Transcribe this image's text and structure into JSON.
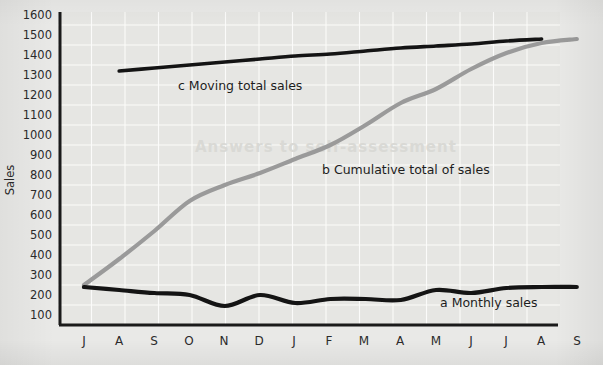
{
  "chart_data": {
    "type": "line",
    "title": "",
    "xlabel": "",
    "ylabel": "Sales",
    "ylim": [
      0,
      1600
    ],
    "ytick_step": 100,
    "grid": true,
    "legend": "inline-annotations",
    "categories": [
      "J",
      "A",
      "S",
      "O",
      "N",
      "D",
      "J",
      "F",
      "M",
      "A",
      "M",
      "J",
      "J",
      "A",
      "S"
    ],
    "yticks": [
      1600,
      1500,
      1400,
      1300,
      1200,
      1100,
      1000,
      900,
      800,
      700,
      600,
      500,
      400,
      300,
      200,
      100
    ],
    "series": [
      {
        "key": "a",
        "name": "Monthly sales",
        "color": "#141414",
        "label": "a  Monthly sales",
        "values": [
          190,
          175,
          160,
          150,
          95,
          150,
          110,
          130,
          130,
          125,
          175,
          160,
          185,
          190,
          190
        ]
      },
      {
        "key": "b",
        "name": "Cumulative total of sales",
        "color": "#9a9a9a",
        "label": "b  Cumulative total of sales",
        "values": [
          200,
          330,
          470,
          620,
          700,
          760,
          830,
          900,
          1000,
          1110,
          1180,
          1280,
          1360,
          1410,
          1430
        ]
      },
      {
        "key": "c",
        "name": "Moving total sales",
        "color": "#141414",
        "label": "c  Moving total sales",
        "values": [
          null,
          1270,
          1285,
          1300,
          1315,
          1330,
          1345,
          1355,
          1370,
          1385,
          1395,
          1405,
          1420,
          1430,
          null
        ]
      }
    ],
    "annotations": [
      {
        "key": "c",
        "text": "c  Moving total sales",
        "x_px": 178,
        "y_px": 90
      },
      {
        "key": "b",
        "text": "b  Cumulative total of sales",
        "x_px": 322,
        "y_px": 174
      },
      {
        "key": "a",
        "text": "a  Monthly sales",
        "x_px": 440,
        "y_px": 307
      }
    ]
  },
  "axes": {
    "y_title": "Sales",
    "y_labels": [
      "1600",
      "1500",
      "1400",
      "1300",
      "1200",
      "1100",
      "1000",
      "900",
      "800",
      "700",
      "600",
      "500",
      "400",
      "300",
      "200",
      "100"
    ],
    "x_labels": [
      "J",
      "A",
      "S",
      "O",
      "N",
      "D",
      "J",
      "F",
      "M",
      "A",
      "M",
      "J",
      "J",
      "A",
      "S"
    ]
  },
  "watermark": {
    "text": "Answers to self-assessment"
  }
}
